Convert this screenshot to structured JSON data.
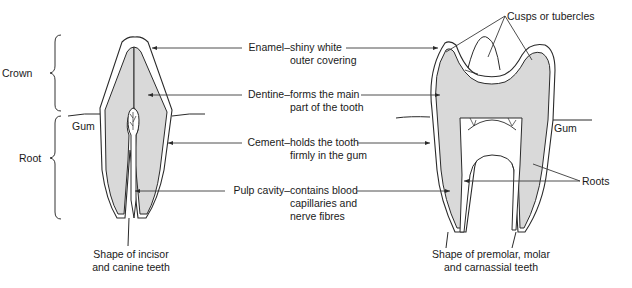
{
  "diagram": {
    "colors": {
      "outline": "#2a2a2a",
      "dentine_fill": "#d9d9d9",
      "enamel_fill": "#ffffff",
      "leader_line": "#3a3a3a"
    },
    "regions": {
      "crown": "Crown",
      "root": "Root"
    },
    "gum_left": "Gum",
    "gum_right": "Gum",
    "center_labels": [
      {
        "term": "Enamel",
        "dash": "–",
        "line1": "shiny white",
        "line2": "outer covering",
        "line3": ""
      },
      {
        "term": "Dentine",
        "dash": "–",
        "line1": "forms the main",
        "line2": "part of the tooth",
        "line3": ""
      },
      {
        "term": "Cement",
        "dash": "–",
        "line1": "holds the tooth",
        "line2": "firmly in the gum",
        "line3": ""
      },
      {
        "term": "Pulp cavity",
        "dash": "–",
        "line1": "contains blood",
        "line2": "capillaries and",
        "line3": "nerve fibres"
      }
    ],
    "cusps_label": "Cusps or tubercles",
    "roots_label": "Roots",
    "left_caption": {
      "line1": "Shape of incisor",
      "line2": "and canine teeth"
    },
    "right_caption": {
      "line1": "Shape of premolar, molar",
      "line2": "and carnassial teeth"
    }
  }
}
